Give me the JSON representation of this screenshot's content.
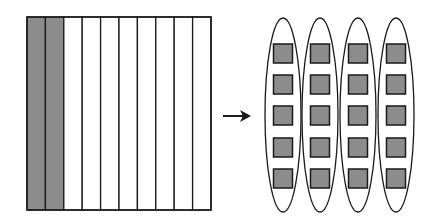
{
  "diagram": {
    "colors": {
      "background": "#ffffff",
      "stroke": "#1a1a1a",
      "shade": "#8c8c8c"
    },
    "left_square": {
      "x": 27,
      "y": 17,
      "width": 184,
      "height": 193,
      "strip_count": 10,
      "shaded_strips": 2
    },
    "arrow": {
      "x1": 223,
      "y1": 116,
      "x2": 251,
      "y2": 116
    },
    "groups": {
      "count": 4,
      "items_per_group": 5,
      "centers_x": [
        283,
        320,
        358,
        396
      ],
      "ellipse_cy": 115,
      "ellipse_rx": 18,
      "ellipse_ry": 97,
      "square_size": 19,
      "square_tops": [
        44,
        75,
        106,
        138,
        169
      ]
    }
  }
}
